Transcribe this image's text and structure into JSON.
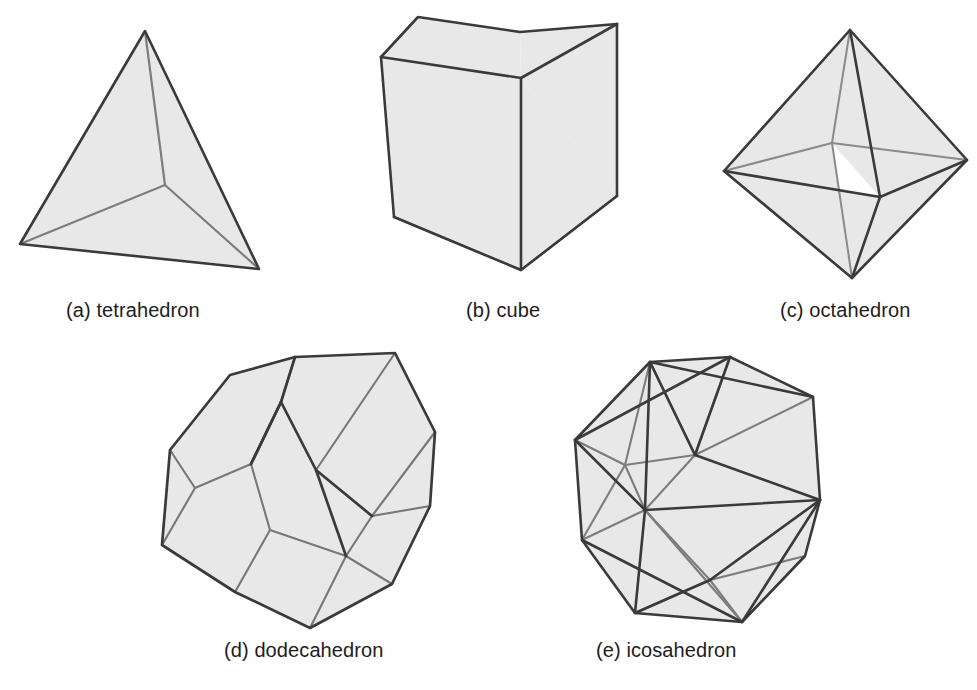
{
  "figure": {
    "background_color": "#ffffff",
    "face_fill_color": "#e8e8e8",
    "outline_color": "#3a3a3a",
    "inner_edge_color": "#7d7d7d",
    "caption_color": "#1d1d1d"
  },
  "solids": [
    {
      "key": "tetrahedron",
      "label": "(a) tetrahedron",
      "letter": "(a)",
      "name": "tetrahedron",
      "faces": 4,
      "row": 1,
      "column": 1
    },
    {
      "key": "cube",
      "label": "(b) cube",
      "letter": "(b)",
      "name": "cube",
      "faces": 6,
      "row": 1,
      "column": 2
    },
    {
      "key": "octahedron",
      "label": "(c) octahedron",
      "letter": "(c)",
      "name": "octahedron",
      "faces": 8,
      "row": 1,
      "column": 3
    },
    {
      "key": "dodecahedron",
      "label": "(d) dodecahedron",
      "letter": "(d)",
      "name": "dodecahedron",
      "faces": 12,
      "row": 2,
      "column": 1
    },
    {
      "key": "icosahedron",
      "label": "(e) icosahedron",
      "letter": "(e)",
      "name": "icosahedron",
      "faces": 20,
      "row": 2,
      "column": 2
    }
  ],
  "captions": {
    "tetrahedron": "(a) tetrahedron",
    "cube": "(b) cube",
    "octahedron": "(c) octahedron",
    "dodecahedron": "(d) dodecahedron",
    "icosahedron": "(e) icosahedron"
  }
}
